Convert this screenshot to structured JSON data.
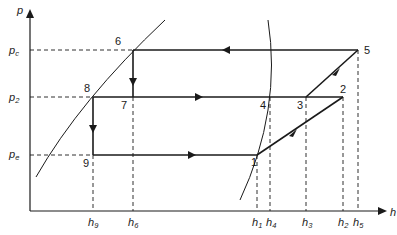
{
  "diagram": {
    "type": "p-h diagram (refrigeration cycle)",
    "axes": {
      "y_label": "p",
      "x_label": "h",
      "y_ticks": [
        {
          "base": "p",
          "sub": "c"
        },
        {
          "base": "p",
          "sub": "2"
        },
        {
          "base": "p",
          "sub": "e"
        }
      ],
      "x_ticks": [
        {
          "base": "h",
          "sub": "9"
        },
        {
          "base": "h",
          "sub": "6"
        },
        {
          "base": "h",
          "sub": "1"
        },
        {
          "base": "h",
          "sub": "4"
        },
        {
          "base": "h",
          "sub": "3"
        },
        {
          "base": "h",
          "sub": "2"
        },
        {
          "base": "h",
          "sub": "5"
        }
      ]
    },
    "points": [
      {
        "id": "1",
        "label": "1"
      },
      {
        "id": "2",
        "label": "2"
      },
      {
        "id": "3",
        "label": "3"
      },
      {
        "id": "4",
        "label": "4"
      },
      {
        "id": "5",
        "label": "5"
      },
      {
        "id": "6",
        "label": "6"
      },
      {
        "id": "7",
        "label": "7"
      },
      {
        "id": "8",
        "label": "8"
      },
      {
        "id": "9",
        "label": "9"
      }
    ],
    "processes": [
      {
        "from": "1",
        "to": "2"
      },
      {
        "from": "2",
        "to": "3"
      },
      {
        "from": "3",
        "to": "5"
      },
      {
        "from": "5",
        "to": "6"
      },
      {
        "from": "6",
        "to": "7"
      },
      {
        "from": "7",
        "to": "8"
      },
      {
        "from": "8",
        "to": "9"
      },
      {
        "from": "9",
        "to": "1"
      }
    ],
    "colors": {
      "line": "#1a1a1a",
      "background": "#ffffff"
    }
  }
}
